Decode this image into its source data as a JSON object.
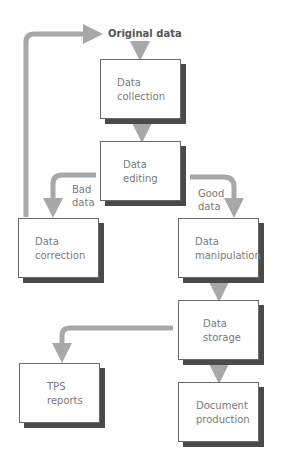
{
  "top_fragment": "... s i g n o t i p r o c e s s i n g ...",
  "title": "Original data",
  "nodes": {
    "collection": "Data\ncollection",
    "editing": "Data\nediting",
    "correction": "Data\ncorrection",
    "manipulation": "Data\nmanipulation",
    "storage": "Data\nstorage",
    "tps": "TPS\nreports",
    "document": "Document\nproduction"
  },
  "edges": {
    "bad": "Bad\ndata",
    "good": "Good\ndata"
  },
  "colors": {
    "arrow": "#a8a8a8",
    "shadow": "#4a4a4a",
    "text": "#7a7a7a"
  }
}
